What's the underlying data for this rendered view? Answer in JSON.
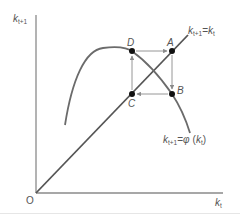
{
  "diagram": {
    "type": "phase-diagram",
    "colors": {
      "axis": "#8a8a8a",
      "curve": "#6b6b6b",
      "diagonal": "#555555",
      "arrows": "#8a8a8a",
      "points": "#111111",
      "text": "#555555"
    },
    "axes": {
      "y_label": {
        "base": "k",
        "sub": "t+1"
      },
      "x_label": {
        "base": "k",
        "sub": "t"
      },
      "origin_label": "O"
    },
    "lines": {
      "diagonal_label": {
        "lhs_base": "k",
        "lhs_sub": "t+1",
        "eq": "=",
        "rhs_base": "k",
        "rhs_sub": "t"
      },
      "curve_label": {
        "lhs_base": "k",
        "lhs_sub": "t+1",
        "eq": "=",
        "func": "φ",
        "arg_base": "k",
        "arg_sub": "t"
      }
    },
    "points": [
      {
        "id": "D",
        "label": "D",
        "x": 132,
        "y": 51
      },
      {
        "id": "A",
        "label": "A",
        "x": 172,
        "y": 51
      },
      {
        "id": "B",
        "label": "B",
        "x": 172,
        "y": 94
      },
      {
        "id": "C",
        "label": "C",
        "x": 132,
        "y": 94
      }
    ],
    "cycle_arrows": [
      "D→A",
      "A→B",
      "B→C",
      "C→D"
    ]
  }
}
